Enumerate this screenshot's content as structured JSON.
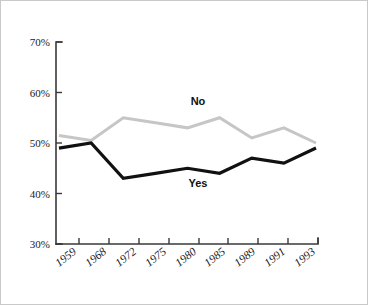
{
  "chart_data": {
    "type": "line",
    "title": "",
    "xlabel": "",
    "ylabel": "",
    "categories": [
      "1959",
      "1968",
      "1972",
      "1975",
      "1980",
      "1985",
      "1989",
      "1991",
      "1993"
    ],
    "ylim": [
      30,
      70
    ],
    "ytick_labels": [
      "70%",
      "60%",
      "50%",
      "40%",
      "30%"
    ],
    "ytick_values": [
      70,
      60,
      50,
      40,
      30
    ],
    "grid": false,
    "legend_position": "inline-annotations",
    "series": [
      {
        "name": "No",
        "color": "#c6c6c6",
        "values": [
          51.5,
          50.5,
          55,
          54,
          53,
          55,
          51,
          53,
          50
        ]
      },
      {
        "name": "Yes",
        "color": "#111111",
        "values": [
          49,
          50,
          43,
          44,
          45,
          44,
          47,
          46,
          49
        ]
      }
    ],
    "annotations": [
      {
        "text": "No",
        "x": 1980,
        "y": 58
      },
      {
        "text": "Yes",
        "x": 1980,
        "y": 41.5
      }
    ]
  },
  "labels": {
    "ytick_0": "70%",
    "ytick_1": "60%",
    "ytick_2": "50%",
    "ytick_3": "40%",
    "ytick_4": "30%",
    "xtick_0": "1959",
    "xtick_1": "1968",
    "xtick_2": "1972",
    "xtick_3": "1975",
    "xtick_4": "1980",
    "xtick_5": "1985",
    "xtick_6": "1989",
    "xtick_7": "1991",
    "xtick_8": "1993",
    "series_no": "No",
    "series_yes": "Yes"
  },
  "colors": {
    "no_line": "#c6c6c6",
    "yes_line": "#111111",
    "axis": "#3a3a3a",
    "frame": "#c9c9c9",
    "background": "#ffffff"
  }
}
